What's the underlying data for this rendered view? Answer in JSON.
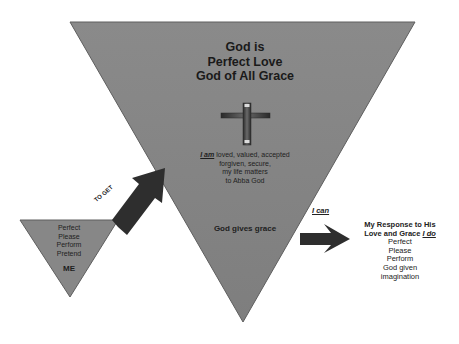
{
  "diagram": {
    "colors": {
      "triangle_fill": "#8c8c8c",
      "triangle_stroke": "#5a5a5a",
      "arrow_fill": "#2e2e2e",
      "cross_fill": "#3f3f3f",
      "background": "#ffffff"
    },
    "big_triangle": {
      "title_lines": [
        "God is",
        "Perfect Love",
        "God of All Grace"
      ],
      "icon": "cross-icon",
      "identity": {
        "emphasis": "I am",
        "line1_rest": " loved, valued, accepted",
        "line2": "forgiven, secure,",
        "line3": "my life matters",
        "line4": "to Abba God"
      },
      "bottom_text": "God gives grace"
    },
    "small_triangle": {
      "items": [
        "Perfect",
        "Please",
        "Perform",
        "Pretend"
      ],
      "label": "ME"
    },
    "arrow_to_get": {
      "label": "TO GET"
    },
    "arrow_i_can": {
      "label": "I can"
    },
    "response": {
      "heading_line1": "My Response to His",
      "heading_line2_prefix": "Love and Grace ",
      "heading_line2_emphasis": "I do",
      "items": [
        "Perfect",
        "Please",
        "Perform",
        "God given",
        "imagination"
      ]
    }
  }
}
